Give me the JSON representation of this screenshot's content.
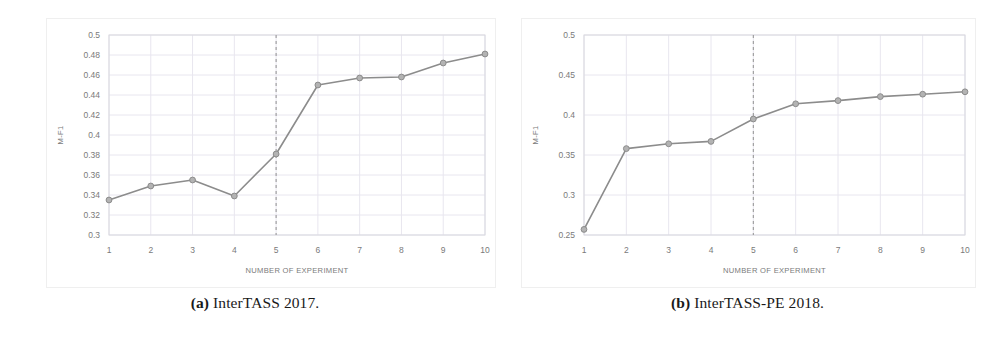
{
  "figure": {
    "subfigures": [
      {
        "tag": "(a)",
        "caption": "InterTASS 2017.",
        "caption_full": "(a) InterTASS 2017."
      },
      {
        "tag": "(b)",
        "caption": "InterTASS-PE 2018.",
        "caption_full": "(b) InterTASS-PE 2018."
      }
    ]
  },
  "colors": {
    "line": "#8c8c8c",
    "marker_fill": "#b3b3b3",
    "marker_stroke": "#8c8c8c",
    "grid": "#e8e6ef",
    "axis": "#d9d9e0",
    "tick_text": "#7a7a7a",
    "reference_line": "#9a9a9a",
    "panel_border": "#efefef",
    "background": "#ffffff"
  },
  "chart_data": [
    {
      "type": "line",
      "title": "InterTASS 2017",
      "xlabel": "NUMBER OF EXPERIMENT",
      "ylabel": "M-F1",
      "x": [
        1,
        2,
        3,
        4,
        5,
        6,
        7,
        8,
        9,
        10
      ],
      "xticklabels": [
        "1",
        "2",
        "3",
        "4",
        "5",
        "6",
        "7",
        "8",
        "9",
        "10"
      ],
      "values": [
        0.335,
        0.349,
        0.355,
        0.339,
        0.381,
        0.45,
        0.457,
        0.458,
        0.472,
        0.481
      ],
      "yticks": [
        0.3,
        0.32,
        0.34,
        0.36,
        0.38,
        0.4,
        0.42,
        0.44,
        0.46,
        0.48,
        0.5
      ],
      "yticklabels": [
        "0.3",
        "0.32",
        "0.34",
        "0.36",
        "0.38",
        "0.4",
        "0.42",
        "0.44",
        "0.46",
        "0.48",
        "0.5"
      ],
      "ylim": [
        0.3,
        0.5
      ],
      "xlim": [
        1,
        10
      ],
      "grid": true,
      "legend": null,
      "annotations": [
        {
          "kind": "vertical-dashed-line",
          "x": 5
        }
      ]
    },
    {
      "type": "line",
      "title": "InterTASS-PE 2018",
      "xlabel": "NUMBER OF EXPERIMENT",
      "ylabel": "M-F1",
      "x": [
        1,
        2,
        3,
        4,
        5,
        6,
        7,
        8,
        9,
        10
      ],
      "xticklabels": [
        "1",
        "2",
        "3",
        "4",
        "5",
        "6",
        "7",
        "8",
        "9",
        "10"
      ],
      "values": [
        0.257,
        0.358,
        0.364,
        0.367,
        0.395,
        0.414,
        0.418,
        0.423,
        0.426,
        0.429
      ],
      "yticks": [
        0.25,
        0.3,
        0.35,
        0.4,
        0.45,
        0.5
      ],
      "yticklabels": [
        "0.25",
        "0.3",
        "0.35",
        "0.4",
        "0.45",
        "0.5"
      ],
      "ylim": [
        0.25,
        0.5
      ],
      "xlim": [
        1,
        10
      ],
      "grid": true,
      "legend": null,
      "annotations": [
        {
          "kind": "vertical-dashed-line",
          "x": 5
        }
      ]
    }
  ]
}
